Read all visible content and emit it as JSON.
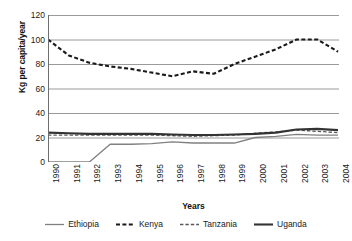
{
  "chart_data": {
    "type": "line",
    "title": "",
    "xlabel": "Years",
    "ylabel": "Kg per capita/year",
    "x": [
      1990,
      1991,
      1992,
      1993,
      1994,
      1995,
      1996,
      1997,
      1998,
      1999,
      2000,
      2001,
      2002,
      2003,
      2004
    ],
    "categories": [
      "1990",
      "1991",
      "1992",
      "1993",
      "1994",
      "1995",
      "1996",
      "1997",
      "1998",
      "1999",
      "2000",
      "2001",
      "2002",
      "2003",
      "2004"
    ],
    "ylim": [
      0,
      120
    ],
    "yticks": [
      0,
      20,
      40,
      60,
      80,
      100,
      120
    ],
    "ytick_labels": [
      "0",
      "20",
      "40",
      "60",
      "80",
      "100",
      "120"
    ],
    "grid": "horizontal",
    "legend_position": "bottom",
    "series": [
      {
        "name": "Ethiopia",
        "style": "solid-thin",
        "color": "#808080",
        "values": [
          0,
          0,
          0,
          14.5,
          14.5,
          15,
          16.5,
          15.5,
          15.5,
          15.5,
          20,
          21,
          22.5,
          22,
          22
        ]
      },
      {
        "name": "Kenya",
        "style": "dashed-thick",
        "color": "#1a1a1a",
        "values": [
          100,
          87,
          81,
          78,
          76,
          73,
          70,
          74,
          72,
          80,
          86,
          92,
          100,
          100,
          90
        ]
      },
      {
        "name": "Tanzania",
        "style": "dashed-thin",
        "color": "#595959",
        "values": [
          22,
          22,
          22,
          22,
          22,
          22,
          21.5,
          21,
          21.5,
          22,
          23.5,
          24.5,
          26,
          25,
          24
        ]
      },
      {
        "name": "Uganda",
        "style": "solid-thick",
        "color": "#333333",
        "values": [
          24,
          23.5,
          23,
          23,
          23,
          23,
          22.5,
          22,
          22,
          22.5,
          23,
          24,
          26.5,
          27,
          26
        ]
      }
    ]
  },
  "axes": {
    "y_title": "Kg per capita/year",
    "x_title": "Years"
  },
  "legend": {
    "items": [
      {
        "label": "Ethiopia"
      },
      {
        "label": "Kenya"
      },
      {
        "label": "Tanzania"
      },
      {
        "label": "Uganda"
      }
    ]
  },
  "colors": {
    "gridline": "#9a9a9a",
    "axis": "#6e6e6e",
    "ethiopia": "#808080",
    "kenya": "#1a1a1a",
    "tanzania": "#595959",
    "uganda": "#333333",
    "background": "#ffffff"
  }
}
